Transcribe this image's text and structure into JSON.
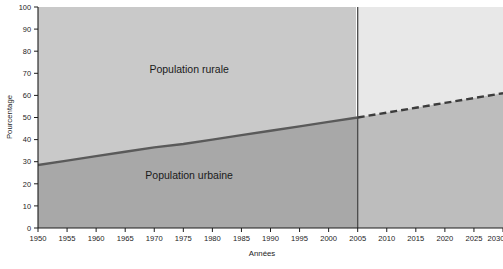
{
  "chart_data": {
    "type": "area",
    "title": "",
    "subtitle": "",
    "xlabel": "Années",
    "ylabel": "Pourcentage",
    "xlim": [
      1950,
      2030
    ],
    "ylim": [
      0,
      100
    ],
    "grid": false,
    "legend_position": "inline-annotations",
    "x_ticks": [
      1950,
      1955,
      1960,
      1965,
      1970,
      1975,
      1980,
      1985,
      1990,
      1995,
      2000,
      2005,
      2010,
      2015,
      2020,
      2025,
      2030
    ],
    "y_ticks": [
      0,
      10,
      20,
      30,
      40,
      50,
      60,
      70,
      80,
      90,
      100
    ],
    "series": [
      {
        "name": "Population urbaine",
        "style": "solid-then-dashed",
        "dash_start_x": 2005,
        "x": [
          1950,
          1955,
          1960,
          1965,
          1970,
          1975,
          1980,
          1985,
          1990,
          1995,
          2000,
          2005,
          2010,
          2015,
          2020,
          2025,
          2030
        ],
        "values": [
          28.5,
          30.5,
          32.5,
          34.5,
          36.5,
          38.0,
          40.0,
          42.0,
          44.0,
          46.0,
          48.0,
          50.0,
          52.2,
          54.4,
          56.6,
          58.8,
          61.0
        ]
      }
    ],
    "annotations": [
      {
        "text": "Population rurale",
        "x": 1976,
        "y": 70,
        "region": "above-line"
      },
      {
        "text": "Population urbaine",
        "x": 1976,
        "y": 22,
        "region": "below-line"
      }
    ],
    "divider": {
      "x": 2005,
      "label": "",
      "meaning": "historique / projection"
    },
    "colors": {
      "line": "#5a5a5a",
      "area_urban_historic": "#a8a8a8",
      "area_rural_historic": "#c9c9c9",
      "area_urban_projection": "#bcbcbc",
      "area_rural_projection": "#e4e4e4",
      "axis": "#1c1c1c",
      "divider": "#4a4a4a",
      "background": "#ffffff"
    }
  },
  "axes": {
    "y_title": "Pourcentage",
    "x_title": "Années",
    "y_tick_labels": [
      "0",
      "10",
      "20",
      "30",
      "40",
      "50",
      "60",
      "70",
      "80",
      "90",
      "100"
    ],
    "x_tick_labels": [
      "1950",
      "1955",
      "1960",
      "1965",
      "1970",
      "1975",
      "1980",
      "1985",
      "1990",
      "1995",
      "2000",
      "2005",
      "2010",
      "2015",
      "2020",
      "2025",
      "2030"
    ]
  },
  "labels": {
    "rural": "Population rurale",
    "urban": "Population urbaine"
  }
}
